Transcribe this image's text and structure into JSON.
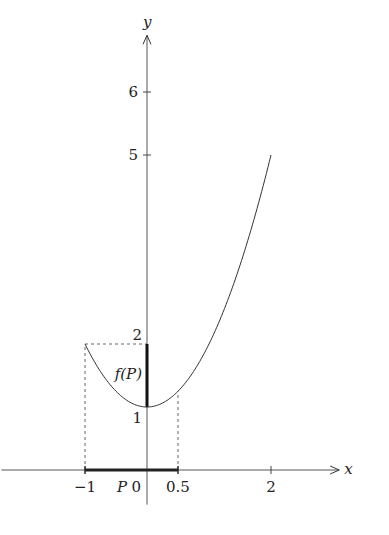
{
  "chart_data": {
    "type": "line",
    "title": "",
    "xlabel": "x",
    "ylabel": "y",
    "xlim": [
      -2.35,
      3.1
    ],
    "ylim": [
      -0.55,
      6.9
    ],
    "function": "f(x) = x^2 + 1",
    "series": [
      {
        "name": "f(x)",
        "x_range": [
          -1,
          2
        ],
        "x": [
          -1,
          -0.5,
          0,
          0.5,
          1,
          1.5,
          2
        ],
        "y": [
          2,
          1.25,
          1,
          1.25,
          2,
          3.25,
          5
        ]
      }
    ],
    "x_ticks": [
      {
        "value": -1,
        "label": "-1"
      },
      {
        "value": 0,
        "label": "0"
      },
      {
        "value": 0.5,
        "label": "0.5"
      },
      {
        "value": 2,
        "label": "2"
      }
    ],
    "y_ticks": [
      {
        "value": 1,
        "label": "1"
      },
      {
        "value": 2,
        "label": "2"
      },
      {
        "value": 5,
        "label": "5"
      },
      {
        "value": 6,
        "label": "6"
      }
    ],
    "interval_P": {
      "label": "P",
      "from": -1,
      "to": 0.5
    },
    "image_fP": {
      "label": "f(P)",
      "from": 1,
      "to": 2
    },
    "guides": [
      {
        "kind": "vertical",
        "x": -1,
        "y_to": 2
      },
      {
        "kind": "horizontal",
        "y": 2,
        "x_from": -1,
        "x_to": 0
      },
      {
        "kind": "vertical",
        "x": 0.5,
        "y_to": 1.25
      }
    ],
    "grid": false,
    "legend": "none"
  }
}
